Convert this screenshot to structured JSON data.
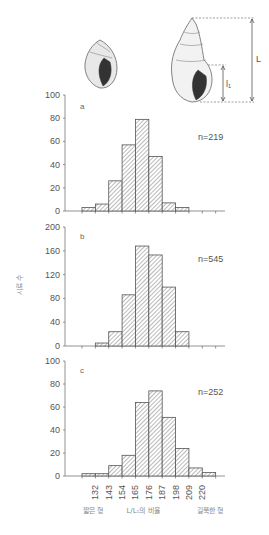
{
  "chart_data": [
    {
      "type": "bar",
      "panel": "a",
      "annotation": "n=219",
      "bin_edges": [
        121,
        132,
        143,
        154,
        165,
        176,
        187,
        198,
        209
      ],
      "values": [
        3,
        6,
        26,
        57,
        79,
        47,
        7,
        3
      ],
      "yticks": [
        0,
        20,
        40,
        60,
        80,
        100
      ],
      "ylim": [
        0,
        100
      ]
    },
    {
      "type": "bar",
      "panel": "b",
      "annotation": "n=545",
      "bin_edges": [
        132,
        143,
        154,
        165,
        176,
        187,
        198,
        209
      ],
      "values": [
        5,
        24,
        86,
        168,
        153,
        99,
        24
      ],
      "yticks": [
        0,
        40,
        80,
        120,
        160,
        200
      ],
      "ylim": [
        0,
        200
      ]
    },
    {
      "type": "bar",
      "panel": "c",
      "annotation": "n=252",
      "bin_edges": [
        121,
        132,
        143,
        154,
        165,
        176,
        187,
        198,
        209,
        220,
        231
      ],
      "values": [
        2,
        2,
        9,
        18,
        64,
        74,
        51,
        24,
        7,
        3
      ],
      "yticks": [
        0,
        20,
        40,
        60,
        80,
        100
      ],
      "ylim": [
        0,
        100
      ]
    }
  ],
  "axes": {
    "ylabel": "시료 수",
    "xlabel": "L/L₁의 비율",
    "xlabel_left": "짧은 형",
    "xlabel_right": "길쭉한 형",
    "xticks": [
      "132",
      "143",
      "154",
      "165",
      "176",
      "187",
      "198",
      "209",
      "220"
    ],
    "xtick_values": [
      132,
      143,
      154,
      165,
      176,
      187,
      198,
      209,
      220
    ]
  },
  "illustration": {
    "label_L": "L",
    "label_l1": "l₁"
  }
}
